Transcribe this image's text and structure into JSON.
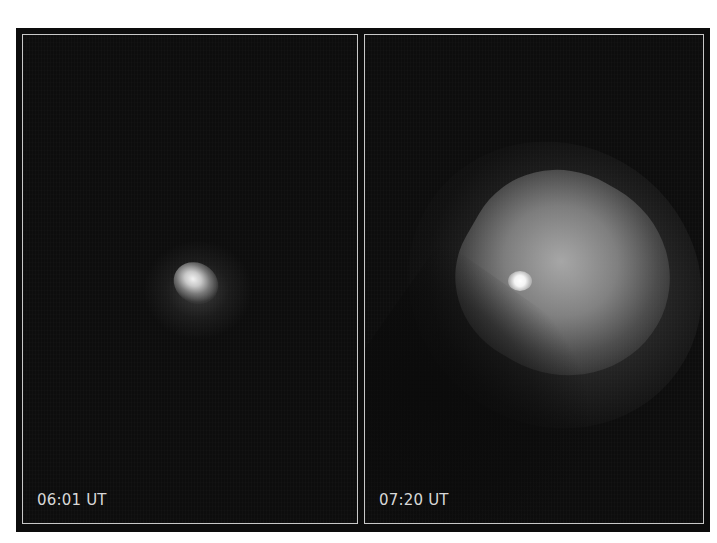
{
  "figure": {
    "panels": [
      {
        "id": "left",
        "timestamp": "06:01 UT",
        "description": "Small compact bright comet coma on dark background"
      },
      {
        "id": "right",
        "timestamp": "07:20 UT",
        "description": "Comet with bright nucleus and large expanded fan-shaped ejecta plume"
      }
    ],
    "colors": {
      "background": "#0c0c0c",
      "panel_border": "#c8c8c8",
      "label_text": "#d8d8d8"
    }
  }
}
